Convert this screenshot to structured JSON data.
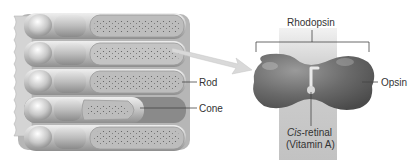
{
  "diagram": {
    "type": "anatomy-illustration",
    "colors": {
      "cells_light": "#d9d9d9",
      "cells_mid": "#a8a8a8",
      "cells_dark": "#6e6e6e",
      "opsin": "#6a6a6a",
      "membrane_band": "#c8c8c8",
      "arrow": "#d6d6d6",
      "text": "#333333"
    },
    "labels": {
      "rod": "Rod",
      "cone": "Cone",
      "rhodopsin": "Rhodopsin",
      "opsin": "Opsin",
      "cis_prefix": "Cis",
      "cis_suffix": "-retinal",
      "vitamin": "(Vitamin A)"
    }
  }
}
